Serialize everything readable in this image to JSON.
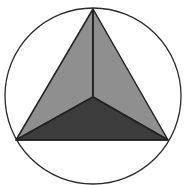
{
  "figure": {
    "title": "",
    "circle": {
      "cx": 93,
      "cy": 96,
      "r": 88,
      "stroke": "#2a2a2a",
      "fill": "#ffffff"
    },
    "vertices": {
      "apex_top": [
        93,
        9
      ],
      "center": [
        93,
        97
      ],
      "bottom_left": [
        16,
        140
      ],
      "bottom_right": [
        168,
        140
      ]
    },
    "faces": [
      {
        "name": "left-face",
        "fill": "#8f8f8f"
      },
      {
        "name": "right-face",
        "fill": "#8f8f8f"
      },
      {
        "name": "bottom-face",
        "fill": "#3c3c3c"
      }
    ],
    "colors": {
      "line": "#222222",
      "light_face": "#8f8f8f",
      "dark_face": "#3c3c3c",
      "background": "#ffffff"
    }
  }
}
